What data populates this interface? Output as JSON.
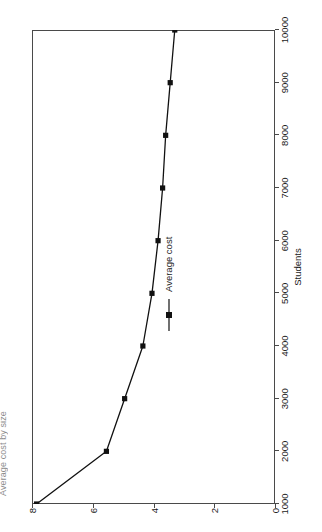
{
  "figure": {
    "clipped_title": "Average cost by size",
    "background": "#ffffff",
    "frame_color": "#4a4a4a",
    "series_color": "#111111"
  },
  "axes": {
    "x_title": "Students",
    "y_title": "Average cost (£ per year) (Thousands)",
    "x_ticks": [
      "1000",
      "2000",
      "3000",
      "4000",
      "5000",
      "6000",
      "7000",
      "8000",
      "9000",
      "10000"
    ],
    "y_ticks": [
      "0",
      "2",
      "4",
      "6",
      "8"
    ]
  },
  "legend": {
    "position": "inside-right",
    "entries": [
      {
        "label": "Average cost",
        "marker": "square-marker",
        "color": "#111111"
      }
    ]
  },
  "chart_data": {
    "type": "line",
    "title": "Average cost by size",
    "xlabel": "Students",
    "ylabel": "Average cost (£ per year) (Thousands)",
    "xlim": [
      1000,
      10000
    ],
    "ylim": [
      0,
      8
    ],
    "grid": false,
    "orientation": "rotated-90-ccw",
    "legend_position": "inside-right",
    "x": [
      1000,
      2000,
      3000,
      4000,
      5000,
      6000,
      7000,
      8000,
      9000,
      10000
    ],
    "series": [
      {
        "name": "Average cost",
        "marker": "square",
        "color": "#111111",
        "values": [
          7.85,
          5.55,
          4.95,
          4.35,
          4.05,
          3.85,
          3.7,
          3.6,
          3.45,
          3.3
        ]
      }
    ]
  }
}
